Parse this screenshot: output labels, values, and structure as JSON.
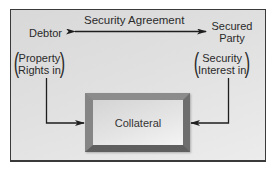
{
  "diagram": {
    "agreement_label": "Security Agreement",
    "left_party": {
      "label": "Debtor",
      "paren_line1": "Property",
      "paren_line2": "Rights in"
    },
    "right_party": {
      "label_line1": "Secured",
      "label_line2": "Party",
      "paren_line1": "Security",
      "paren_line2": "Interest in"
    },
    "center_box": {
      "label": "Collateral"
    },
    "colors": {
      "panel_bg": "#e0e0e0",
      "border": "#3a3a3a",
      "frame": "#7a7a7a",
      "text": "#2a2a2a"
    }
  }
}
